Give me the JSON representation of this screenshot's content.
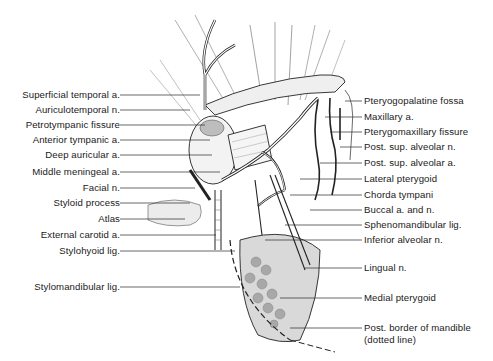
{
  "figure": {
    "colors": {
      "ink": "#1a1a1a",
      "leader": "#2a2a2a",
      "shade": "#9a9a9a",
      "background": "#ffffff"
    }
  },
  "labels_left": [
    {
      "text": "Superficial temporal a.",
      "y": 95
    },
    {
      "text": "Auriculotemporal n.",
      "y": 110
    },
    {
      "text": "Petrotympanic fissure",
      "y": 125
    },
    {
      "text": "Anterior tympanic a.",
      "y": 140
    },
    {
      "text": "Deep auricular a.",
      "y": 155
    },
    {
      "text": "Middle meningeal a.",
      "y": 172
    },
    {
      "text": "Facial n.",
      "y": 188
    },
    {
      "text": "Styloid process",
      "y": 203
    },
    {
      "text": "Atlas",
      "y": 219
    },
    {
      "text": "External carotid a.",
      "y": 235
    },
    {
      "text": "Stylohyoid lig.",
      "y": 251
    },
    {
      "text": "Stylomandibular lig.",
      "y": 287
    }
  ],
  "labels_right": [
    {
      "text": "Pteryogopalatine fossa",
      "y": 97
    },
    {
      "text": "Maxillary a.",
      "y": 113
    },
    {
      "text": "Pterygomaxillary fissure",
      "y": 128
    },
    {
      "text": "Post. sup. alveolar n.",
      "y": 143
    },
    {
      "text": "Post. sup. alveolar a.",
      "y": 159
    },
    {
      "text": "Lateral pterygoid",
      "y": 175
    },
    {
      "text": "Chorda tympani",
      "y": 191
    },
    {
      "text": "Buccal a. and n.",
      "y": 206
    },
    {
      "text": "Sphenomandibular lig.",
      "y": 222
    },
    {
      "text": "Inferior alveolar n.",
      "y": 237
    },
    {
      "text": "Lingual n.",
      "y": 266
    },
    {
      "text": "Medial pterygoid",
      "y": 296
    },
    {
      "text": "Post. border of mandible",
      "y": 326
    },
    {
      "text": "(dotted line)",
      "y": 339
    }
  ],
  "signature": "Lillie · ayer CAH"
}
